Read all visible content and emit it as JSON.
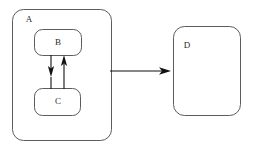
{
  "diagram": {
    "type": "block-diagram",
    "background_color": "#ffffff",
    "node_stroke_color": "#4a4a4a",
    "edge_color": "#111111",
    "label_color": "#2b2b2b",
    "nodes": [
      {
        "id": "A",
        "label": "A",
        "shape": "rounded-rectangle",
        "x": 12,
        "y": 9,
        "width": 100,
        "height": 132,
        "corner_radius": 11,
        "label_x": 29,
        "label_y": 19,
        "label_position": "top-left",
        "container": true
      },
      {
        "id": "B",
        "label": "B",
        "shape": "rounded-rectangle",
        "x": 34,
        "y": 29,
        "width": 48,
        "height": 27,
        "corner_radius": 8,
        "label_x": 58,
        "label_y": 43,
        "label_position": "center",
        "parent": "A"
      },
      {
        "id": "C",
        "label": "C",
        "shape": "rounded-rectangle",
        "x": 34,
        "y": 88,
        "width": 47,
        "height": 28,
        "corner_radius": 8,
        "label_x": 58,
        "label_y": 102,
        "label_position": "center",
        "parent": "A"
      },
      {
        "id": "D",
        "label": "D",
        "shape": "rounded-rectangle",
        "x": 173,
        "y": 26,
        "width": 68,
        "height": 90,
        "corner_radius": 11,
        "label_x": 187,
        "label_y": 45,
        "label_position": "top-left",
        "container": false
      }
    ],
    "edges": [
      {
        "id": "b-to-c",
        "from": "B",
        "to": "C",
        "direction": "down",
        "x": 51,
        "y_start": 55,
        "y_end": 88
      },
      {
        "id": "c-to-b",
        "from": "C",
        "to": "B",
        "direction": "up",
        "x": 64,
        "y_start": 89,
        "y_end": 56
      },
      {
        "id": "a-to-d",
        "from": "A",
        "to": "D",
        "direction": "right",
        "y": 71,
        "x_start": 110,
        "x_end": 172
      }
    ]
  }
}
